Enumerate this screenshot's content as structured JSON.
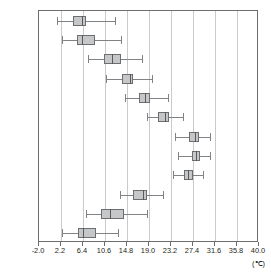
{
  "chart_data": {
    "type": "box",
    "title": "",
    "xlabel": "(℃)",
    "ylabel": "",
    "xlim": [
      -2.0,
      40.0
    ],
    "grid": true,
    "legend": false,
    "unit": "(℃)",
    "xticks": [
      "-2.0",
      "2.2",
      "6.4",
      "10.6",
      "14.8",
      "19.0",
      "23.2",
      "27.4",
      "31.6",
      "35.8",
      "40.0"
    ],
    "xtick_values": [
      -2.0,
      2.2,
      6.4,
      10.6,
      14.8,
      19.0,
      23.2,
      27.4,
      31.6,
      35.8,
      40.0
    ],
    "categories": [
      "1月",
      "2月",
      "3月",
      "4月",
      "5月",
      "6月",
      "7月",
      "8月",
      "9月",
      "10月",
      "11月",
      "12月"
    ],
    "boxes": [
      {
        "category": "1月",
        "min": 1.4,
        "q1": 4.4,
        "median": 6.2,
        "q3": 7.0,
        "max": 12.6
      },
      {
        "category": "2月",
        "min": 2.4,
        "q1": 5.2,
        "median": 6.2,
        "q3": 8.6,
        "max": 13.6
      },
      {
        "category": "3月",
        "min": 7.4,
        "q1": 10.4,
        "median": 12.0,
        "q3": 13.6,
        "max": 17.6
      },
      {
        "category": "4月",
        "min": 10.8,
        "q1": 13.8,
        "median": 15.4,
        "q3": 16.0,
        "max": 19.6
      },
      {
        "category": "5月",
        "min": 14.4,
        "q1": 17.0,
        "median": 18.2,
        "q3": 19.2,
        "max": 22.6
      },
      {
        "category": "6月",
        "min": 18.6,
        "q1": 20.8,
        "median": 22.0,
        "q3": 22.8,
        "max": 25.4
      },
      {
        "category": "7月",
        "min": 24.0,
        "q1": 26.6,
        "median": 27.8,
        "q3": 28.6,
        "max": 30.6
      },
      {
        "category": "8月",
        "min": 24.6,
        "q1": 27.2,
        "median": 28.0,
        "q3": 28.8,
        "max": 30.6
      },
      {
        "category": "9月",
        "min": 23.6,
        "q1": 25.6,
        "median": 26.4,
        "q3": 27.4,
        "max": 29.4
      },
      {
        "category": "10月",
        "min": 13.4,
        "q1": 16.0,
        "median": 17.8,
        "q3": 18.6,
        "max": 21.6
      },
      {
        "category": "11月",
        "min": 7.0,
        "q1": 9.8,
        "median": 11.6,
        "q3": 14.2,
        "max": 18.6
      },
      {
        "category": "12月",
        "min": 2.4,
        "q1": 5.4,
        "median": 6.4,
        "q3": 8.8,
        "max": 13.0
      }
    ],
    "style": {
      "box_fill": "#c6c7c9",
      "box_border": "#6d6e71",
      "whisker": "#808285",
      "median": "#58595b",
      "grid_color": "#c9cacc",
      "frame_color": "#6d6e71"
    }
  }
}
